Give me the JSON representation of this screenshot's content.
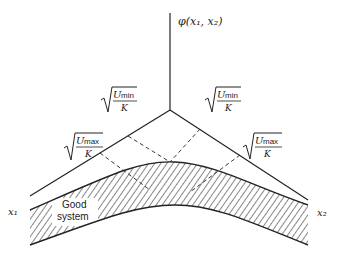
{
  "axes": {
    "vertical_label": "φ(x₁, x₂)",
    "left_label": "x₁",
    "right_label": "x₂",
    "left_label_sub": "1",
    "right_label_sub": "2"
  },
  "labels": {
    "umin_left": {
      "numer": "U",
      "sub": "min",
      "denom": "K"
    },
    "umin_right": {
      "numer": "U",
      "sub": "min",
      "denom": "K"
    },
    "umax_left": {
      "numer": "U",
      "sub": "max",
      "denom": "K"
    },
    "umax_right": {
      "numer": "U",
      "sub": "max",
      "denom": "K"
    },
    "region_line1": "Good",
    "region_line2": "system"
  },
  "colors": {
    "ink": "#222222",
    "background": "#ffffff"
  }
}
